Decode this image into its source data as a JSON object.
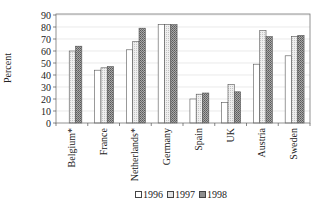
{
  "chart_data": {
    "type": "bar",
    "title": "",
    "xlabel": "",
    "ylabel": "Percent",
    "ylim": [
      0,
      90
    ],
    "yticks": [
      0,
      10,
      20,
      30,
      40,
      50,
      60,
      70,
      80,
      90
    ],
    "grid": true,
    "legend_position": "bottom",
    "categories": [
      "Belgium*",
      "France",
      "Netherlands*",
      "Germany",
      "Spain",
      "UK",
      "Austria",
      "Sweden"
    ],
    "series": [
      {
        "name": "1996",
        "color": "#ffffff",
        "pattern": "white",
        "values": [
          null,
          44,
          61,
          82,
          20,
          17,
          49,
          56
        ]
      },
      {
        "name": "1997",
        "color": "#e2e2e2",
        "pattern": "light-dotted",
        "values": [
          60,
          46,
          68,
          82,
          24,
          32,
          77,
          72
        ]
      },
      {
        "name": "1998",
        "color": "#8e8e8e",
        "pattern": "dark-dotted",
        "values": [
          64,
          47,
          79,
          82,
          25,
          26,
          72,
          73
        ]
      }
    ]
  },
  "legend": {
    "items": [
      {
        "label": "1996",
        "color": "#ffffff"
      },
      {
        "label": "1997",
        "color": "#e2e2e2"
      },
      {
        "label": "1998",
        "color": "#8e8e8e"
      }
    ]
  }
}
